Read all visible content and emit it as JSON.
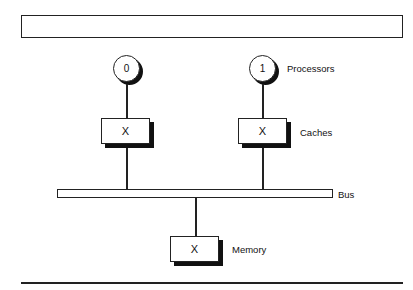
{
  "diagram": {
    "type": "multiprocessor-architecture",
    "processors": {
      "label": "Processors",
      "nodes": [
        {
          "id": "0"
        },
        {
          "id": "1"
        }
      ]
    },
    "caches": {
      "label": "Caches",
      "nodes": [
        {
          "content": "X"
        },
        {
          "content": "X"
        }
      ]
    },
    "bus": {
      "label": "Bus"
    },
    "memory": {
      "label": "Memory",
      "content": "X"
    },
    "edges": [
      {
        "from": "processor-0",
        "to": "cache-0"
      },
      {
        "from": "processor-1",
        "to": "cache-1"
      },
      {
        "from": "cache-0",
        "to": "bus"
      },
      {
        "from": "cache-1",
        "to": "bus"
      },
      {
        "from": "bus",
        "to": "memory"
      }
    ]
  }
}
